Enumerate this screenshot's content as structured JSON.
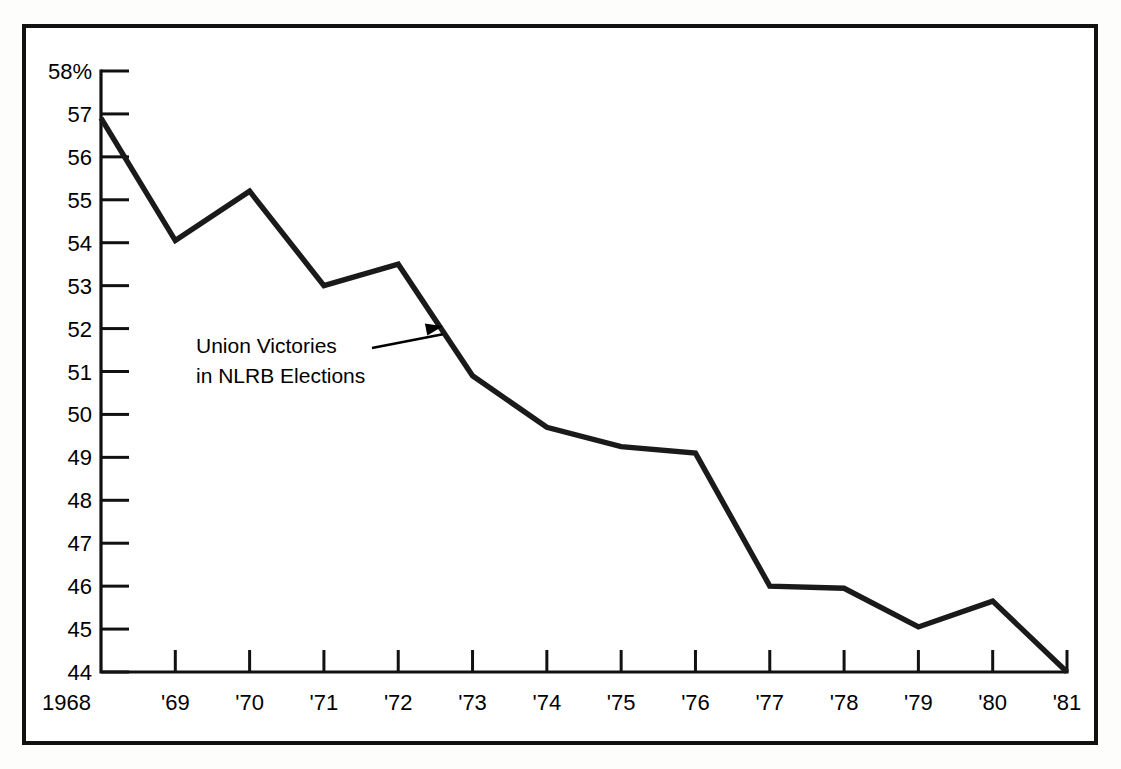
{
  "figure": {
    "background_color": "#ffffff",
    "page_color": "#fdfdfc",
    "line_color": "#1a1a1a",
    "frame_color": "#111111"
  },
  "annotation": {
    "line1": "Union Victories",
    "line2": "in NLRB Elections"
  },
  "chart_data": {
    "type": "line",
    "title": "",
    "subtitle": "",
    "xlabel": "",
    "ylabel": "",
    "series_name": "Union Victories in NLRB Elections",
    "x": [
      1968,
      1969,
      1970,
      1971,
      1972,
      1973,
      1974,
      1975,
      1976,
      1977,
      1978,
      1979,
      1980,
      1981
    ],
    "categories": [
      "1968",
      "'69",
      "'70",
      "'71",
      "'72",
      "'73",
      "'74",
      "'75",
      "'76",
      "'77",
      "'78",
      "'79",
      "'80",
      "'81"
    ],
    "values": [
      56.9,
      54.05,
      55.2,
      53.0,
      53.5,
      50.9,
      49.7,
      49.25,
      49.1,
      46.0,
      45.95,
      45.05,
      45.65,
      44.0
    ],
    "units": "percent",
    "ylim": [
      44,
      58
    ],
    "xlim": [
      1968,
      1981
    ],
    "ytick_labels": [
      "58%",
      "57",
      "56",
      "55",
      "54",
      "53",
      "52",
      "51",
      "50",
      "49",
      "48",
      "47",
      "46",
      "45",
      "44"
    ],
    "ytick_values": [
      58,
      57,
      56,
      55,
      54,
      53,
      52,
      51,
      50,
      49,
      48,
      47,
      46,
      45,
      44
    ],
    "xtick_labels": [
      "1968",
      "'69",
      "'70",
      "'71",
      "'72",
      "'73",
      "'74",
      "'75",
      "'76",
      "'77",
      "'78",
      "'79",
      "'80",
      "'81"
    ],
    "grid": false,
    "legend": false,
    "legend_position": "none",
    "annotations": [
      {
        "text": "Union Victories in NLRB Elections",
        "points_to_x": 1972.6,
        "points_to_y": 52.1
      }
    ]
  }
}
